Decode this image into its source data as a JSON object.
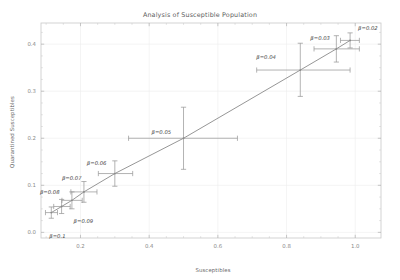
{
  "chart_data": {
    "type": "scatter",
    "title": "Analysis of Susceptible Population",
    "xlabel": "Susceptibles",
    "ylabel": "Quarantined Susceptibles",
    "xlim": [
      0.085,
      1.075
    ],
    "ylim": [
      -0.012,
      0.445
    ],
    "xticks": [
      "0.2",
      "0.4",
      "0.6",
      "0.8",
      "1.0"
    ],
    "xtick_values": [
      0.2,
      0.4,
      0.6,
      0.8,
      1.0
    ],
    "yticks": [
      "0.0",
      "0.1",
      "0.2",
      "0.3",
      "0.4"
    ],
    "ytick_values": [
      0.0,
      0.1,
      0.2,
      0.3,
      0.4
    ],
    "grid": true,
    "legend": "none",
    "line_color": "#8a8a8a",
    "marker_color": "#8a8a8a",
    "errorbar_color": "#9a9a9a",
    "grid_color": "#ececec",
    "frame_color": "#c8c8c8",
    "connected": true,
    "points": [
      {
        "label": "β=0.1",
        "x": 0.115,
        "y": 0.042,
        "xerr_low": 0.098,
        "xerr_high": 0.133,
        "yerr_low": 0.03,
        "yerr_high": 0.054,
        "label_dx": -2,
        "label_dy": 25,
        "label_anchor": "start"
      },
      {
        "label": "β=0.09",
        "x": 0.145,
        "y": 0.055,
        "xerr_low": 0.122,
        "xerr_high": 0.17,
        "yerr_low": 0.04,
        "yerr_high": 0.07,
        "label_dx": 12,
        "label_dy": 17,
        "label_anchor": "start"
      },
      {
        "label": "β=0.08",
        "x": 0.175,
        "y": 0.068,
        "xerr_low": 0.146,
        "xerr_high": 0.205,
        "yerr_low": 0.05,
        "yerr_high": 0.086,
        "label_dx": -32,
        "label_dy": -6,
        "label_anchor": "start"
      },
      {
        "label": "β=0.07",
        "x": 0.21,
        "y": 0.086,
        "xerr_low": 0.172,
        "xerr_high": 0.248,
        "yerr_low": 0.064,
        "yerr_high": 0.108,
        "label_dx": -22,
        "label_dy": -12,
        "label_anchor": "start"
      },
      {
        "label": "β=0.06",
        "x": 0.3,
        "y": 0.125,
        "xerr_low": 0.252,
        "xerr_high": 0.352,
        "yerr_low": 0.098,
        "yerr_high": 0.152,
        "label_dx": -28,
        "label_dy": -9,
        "label_anchor": "start"
      },
      {
        "label": "β=0.05",
        "x": 0.5,
        "y": 0.2,
        "xerr_low": 0.34,
        "xerr_high": 0.657,
        "yerr_low": 0.134,
        "yerr_high": 0.266,
        "label_dx": -32,
        "label_dy": -4,
        "label_anchor": "start"
      },
      {
        "label": "β=0.04",
        "x": 0.84,
        "y": 0.345,
        "xerr_low": 0.713,
        "xerr_high": 0.985,
        "yerr_low": 0.289,
        "yerr_high": 0.402,
        "label_dx": -44,
        "label_dy": -11,
        "label_anchor": "start"
      },
      {
        "label": "β=0.03",
        "x": 0.945,
        "y": 0.39,
        "xerr_low": 0.88,
        "xerr_high": 1.012,
        "yerr_low": 0.362,
        "yerr_high": 0.418,
        "label_dx": -26,
        "label_dy": -9,
        "label_anchor": "start"
      },
      {
        "label": "β=0.02",
        "x": 0.985,
        "y": 0.408,
        "xerr_low": 0.957,
        "xerr_high": 1.012,
        "yerr_low": 0.392,
        "yerr_high": 0.424,
        "label_dx": 8,
        "label_dy": -10,
        "label_anchor": "start"
      }
    ]
  }
}
